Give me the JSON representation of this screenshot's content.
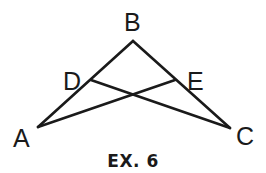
{
  "figure": {
    "caption": "EX. 6",
    "points": {
      "A": {
        "label": "A",
        "x": 38,
        "y": 127
      },
      "B": {
        "label": "B",
        "x": 133,
        "y": 41
      },
      "C": {
        "label": "C",
        "x": 230,
        "y": 128
      },
      "D": {
        "label": "D",
        "x": 91,
        "y": 80
      },
      "E": {
        "label": "E",
        "x": 175,
        "y": 80
      }
    },
    "segments": [
      {
        "from": "A",
        "to": "B"
      },
      {
        "from": "B",
        "to": "C"
      },
      {
        "from": "A",
        "to": "E"
      },
      {
        "from": "D",
        "to": "C"
      }
    ],
    "colors": {
      "ink": "#1a1a1a",
      "background": "#ffffff"
    }
  }
}
